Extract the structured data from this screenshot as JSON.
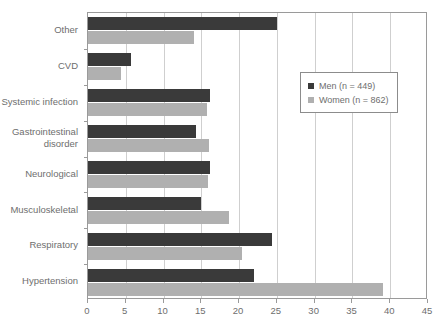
{
  "chart_data": {
    "type": "bar",
    "orientation": "horizontal",
    "title": "",
    "subtitle": "",
    "xlabel": "",
    "ylabel": "",
    "xlim": [
      0,
      45
    ],
    "xticks": [
      0,
      5,
      10,
      15,
      20,
      25,
      30,
      35,
      40,
      45
    ],
    "xtick_labels": [
      "0",
      "5",
      "10",
      "15",
      "20",
      "25",
      "30",
      "35",
      "40",
      "45"
    ],
    "grid": true,
    "grid_axis": "x",
    "legend_position": "upper-right-inside",
    "categories": [
      "Other",
      "CVD",
      "Systemic infection",
      "Gastrointestinal\ndisorder",
      "Neurological",
      "Musculoskeletal",
      "Respiratory",
      "Hypertension"
    ],
    "series": [
      {
        "name": "Men (n = 449)",
        "color": "#3a3a3a",
        "values": [
          25.0,
          5.7,
          16.1,
          14.3,
          16.1,
          15.0,
          24.3,
          22.0
        ]
      },
      {
        "name": "Women (n = 862)",
        "color": "#b0b0b0",
        "values": [
          14.0,
          4.4,
          15.7,
          16.0,
          15.9,
          18.7,
          20.4,
          39.0
        ]
      }
    ],
    "legend": [
      {
        "label": "Men (n = 449)",
        "swatch": "#3a3a3a"
      },
      {
        "label": "Women (n = 862)",
        "swatch": "#b0b0b0"
      }
    ]
  },
  "colors": {
    "men": "#3a3a3a",
    "women": "#b0b0b0",
    "axis": "#9a9a9a",
    "grid": "#cfcfcf",
    "text": "#6e6e6e",
    "background": "#ffffff"
  }
}
